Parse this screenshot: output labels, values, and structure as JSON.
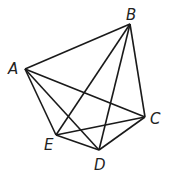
{
  "vertices": {
    "A": {
      "label": "A",
      "x": 25,
      "y": 69,
      "lx": 8,
      "ly": 74
    },
    "B": {
      "label": "B",
      "x": 130,
      "y": 24,
      "lx": 126,
      "ly": 20
    },
    "C": {
      "label": "C",
      "x": 145,
      "y": 117,
      "lx": 150,
      "ly": 124
    },
    "D": {
      "label": "D",
      "x": 99,
      "y": 150,
      "lx": 94,
      "ly": 170
    },
    "E": {
      "label": "E",
      "x": 56,
      "y": 135,
      "lx": 44,
      "ly": 150
    }
  },
  "edges": [
    [
      "A",
      "B"
    ],
    [
      "A",
      "C"
    ],
    [
      "A",
      "D"
    ],
    [
      "A",
      "E"
    ],
    [
      "B",
      "C"
    ],
    [
      "B",
      "D"
    ],
    [
      "B",
      "E"
    ],
    [
      "C",
      "D"
    ],
    [
      "C",
      "E"
    ],
    [
      "E",
      "D"
    ]
  ]
}
